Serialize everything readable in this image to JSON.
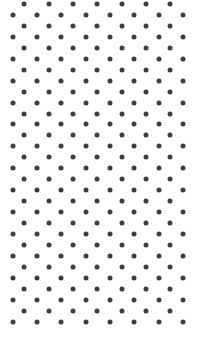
{
  "pattern": {
    "type": "staggered-dot-grid",
    "rows": 30,
    "dot_color": "#3d3d3d",
    "background_color": "#ffffff",
    "dot_diameter": 5,
    "row_spacing": 10.95,
    "col_spacing": 24.35,
    "first_row_y": 4,
    "odd_row": {
      "start_x": 24.3,
      "count": 7
    },
    "even_row": {
      "start_x": 12.7,
      "count": 8
    }
  }
}
